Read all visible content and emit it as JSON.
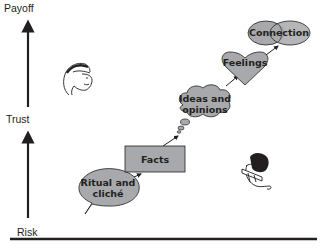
{
  "axis": {
    "labels": {
      "payoff": "Payoff",
      "trust": "Trust",
      "risk": "Risk"
    }
  },
  "stages": [
    {
      "id": "ritual",
      "line1": "Ritual and",
      "line2": "cliché",
      "shape": "speech-bubble"
    },
    {
      "id": "facts",
      "line1": "Facts",
      "shape": "rectangle"
    },
    {
      "id": "ideas",
      "line1": "Ideas and",
      "line2": "opinions",
      "shape": "thought-cloud"
    },
    {
      "id": "feelings",
      "line1": "Feelings",
      "shape": "heart"
    },
    {
      "id": "connection",
      "line1": "Connection",
      "shape": "overlapping-circles"
    }
  ],
  "illustrations": {
    "top_left": "person-face-icon",
    "bottom_right": "person-face-icon"
  },
  "colors": {
    "node_fill": "#a7a9ac",
    "stroke": "#231f20",
    "background": "#ffffff"
  }
}
